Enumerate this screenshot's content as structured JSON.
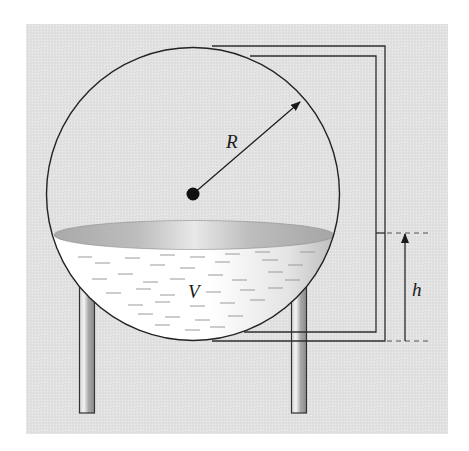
{
  "figure": {
    "labels": {
      "radius": "R",
      "volume": "V",
      "height": "h"
    },
    "colors": {
      "background_panel": "#e3e3e3",
      "outline": "#2a2a2a",
      "liquid_light": "#ffffff",
      "liquid_shade": "#b5b5b5",
      "surface_dark": "#a6a6a6",
      "surface_light": "#e6e6e6",
      "leg_light": "#f2f2f2",
      "leg_dark": "#8c8c8c",
      "dash_color": "#7a7a7a"
    },
    "components": [
      "sphere-tank",
      "center-point",
      "radius-arrow",
      "liquid-surface",
      "liquid-volume",
      "support-legs",
      "sight-gauge-pipe",
      "height-dimension"
    ]
  }
}
